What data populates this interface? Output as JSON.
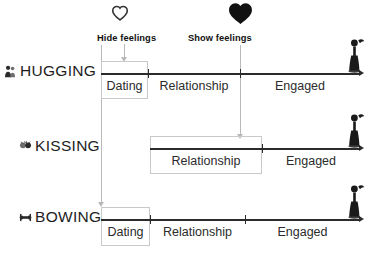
{
  "diagram": {
    "title_visible": false,
    "colors": {
      "axis": "#2b2b2b",
      "box_border": "#c9c9c9",
      "guide_line": "#b9b9b9",
      "text": "#1d1d1d",
      "heart_filled": "#111111",
      "heart_outline": "#333333"
    }
  },
  "annotations": [
    {
      "id": "hide-feelings",
      "label": "Hide feelings",
      "icon": "heart-outline-icon",
      "x": 101
    },
    {
      "id": "show-feelings",
      "label": "Show feelings",
      "icon": "heart-filled-icon",
      "x": 240
    }
  ],
  "rows": [
    {
      "id": "hugging",
      "label": "HUGGING",
      "icon": "hugging-couple-icon",
      "end_icon": "standing-figure-icon",
      "highlighted_stage": "Dating",
      "segments": [
        {
          "label": "Dating",
          "start": 101,
          "end": 148,
          "highlighted": true
        },
        {
          "label": "Relationship",
          "start": 148,
          "end": 240,
          "highlighted": false
        },
        {
          "label": "Engaged",
          "start": 240,
          "end": 360,
          "highlighted": false
        }
      ]
    },
    {
      "id": "kissing",
      "label": "KISSING",
      "icon": "kissing-couple-icon",
      "end_icon": "standing-figure-icon",
      "highlighted_stage": "Relationship",
      "segments": [
        {
          "label": "Relationship",
          "start": 150,
          "end": 262,
          "highlighted": true
        },
        {
          "label": "Engaged",
          "start": 262,
          "end": 360,
          "highlighted": false
        }
      ]
    },
    {
      "id": "bowing",
      "label": "BOWING",
      "icon": "bowing-couple-icon",
      "end_icon": "standing-figure-icon",
      "highlighted_stage": "Dating",
      "segments": [
        {
          "label": "Dating",
          "start": 101,
          "end": 150,
          "highlighted": true
        },
        {
          "label": "Relationship",
          "start": 150,
          "end": 245,
          "highlighted": false
        },
        {
          "label": "Engaged",
          "start": 245,
          "end": 360,
          "highlighted": false
        }
      ]
    }
  ],
  "text": {
    "hugging": "HUGGING",
    "kissing": "KISSING",
    "bowing": "BOWING",
    "dating": "Dating",
    "relationship": "Relationship",
    "engaged": "Engaged",
    "hide_feelings": "Hide feelings",
    "show_feelings": "Show feelings"
  }
}
